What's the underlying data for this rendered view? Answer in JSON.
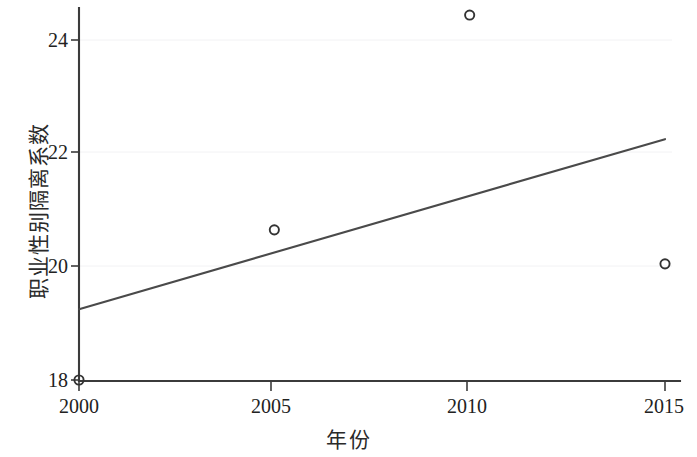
{
  "chart_data": {
    "type": "scatter",
    "title": "",
    "subtitle": "",
    "xlabel": "年份",
    "ylabel": "职业性别隔离系数",
    "xlim": [
      1999.5,
      2015.5
    ],
    "ylim": [
      17.6,
      24.8
    ],
    "grid": true,
    "grid_axis": "y",
    "legend": false,
    "legend_position": "none",
    "x_ticks": [
      2000,
      2005,
      2010,
      2015
    ],
    "x_tick_labels": [
      "2000",
      "2005",
      "2010",
      "2015"
    ],
    "y_ticks": [
      18,
      20,
      22,
      24
    ],
    "y_tick_labels": [
      "18",
      "20",
      "22",
      "24"
    ],
    "series": [
      {
        "name": "职业性别隔离系数",
        "type": "scatter",
        "marker": "open-circle",
        "color": "#333333",
        "x": [
          2000,
          2005,
          2010,
          2015
        ],
        "values": [
          18.0,
          20.65,
          24.44,
          20.05
        ]
      },
      {
        "name": "趋势线",
        "type": "line",
        "color": "#4a4a4a",
        "x": [
          2000,
          2015
        ],
        "values": [
          19.25,
          22.25
        ]
      }
    ],
    "points": [
      {
        "x": 2000,
        "y": 18.0
      },
      {
        "x": 2005,
        "y": 20.65
      },
      {
        "x": 2010,
        "y": 24.44
      },
      {
        "x": 2015,
        "y": 20.05
      }
    ],
    "trend": {
      "x_start": 2000,
      "y_start": 19.25,
      "x_end": 2015,
      "y_end": 22.25
    },
    "colors": {
      "axis": "#3b3b3b",
      "grid": "#f2f2f4",
      "marker": "#333333",
      "trend": "#4a4a4a",
      "background": "#ffffff"
    }
  },
  "axes": {
    "y_title": "职业性别隔离系数",
    "x_title": "年份",
    "y_labels": [
      "24",
      "22",
      "20",
      "18"
    ],
    "x_labels": [
      "2000",
      "2005",
      "2010",
      "2015"
    ]
  }
}
